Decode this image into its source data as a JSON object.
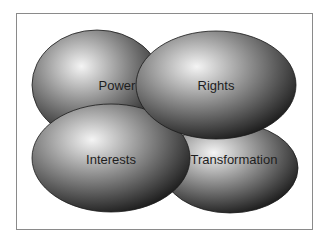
{
  "diagram": {
    "type": "overlapping-ellipses",
    "frame": {
      "x": 16,
      "y": 13,
      "width": 296,
      "height": 216,
      "stroke": "#8a8a8a"
    },
    "gradient": {
      "highlight": "#f4f4f4",
      "mid": "#8c8c8c",
      "edge": "#101010"
    },
    "ellipses": [
      {
        "id": "power",
        "label": "Power",
        "cx": 97,
        "cy": 85,
        "rx": 65,
        "ry": 55,
        "label_x": 117,
        "label_y": 90
      },
      {
        "id": "transformation",
        "label": "Transformation",
        "cx": 230,
        "cy": 168,
        "rx": 68,
        "ry": 45,
        "label_x": 234,
        "label_y": 164
      },
      {
        "id": "interests",
        "label": "Interests",
        "cx": 111,
        "cy": 158,
        "rx": 79,
        "ry": 54,
        "label_x": 111,
        "label_y": 164
      },
      {
        "id": "rights",
        "label": "Rights",
        "cx": 216,
        "cy": 85,
        "rx": 80,
        "ry": 54,
        "label_x": 216,
        "label_y": 90
      }
    ]
  }
}
